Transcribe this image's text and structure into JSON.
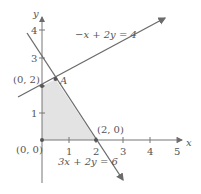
{
  "axes": {
    "x_label": "x",
    "y_label": "y",
    "x_ticks": [
      "1",
      "2",
      "3",
      "4",
      "5"
    ],
    "y_ticks": [
      "1",
      "2",
      "3",
      "4"
    ]
  },
  "lines": [
    {
      "equation": "−x + 2y = 4"
    },
    {
      "equation": "3x + 2y = 6"
    }
  ],
  "points": {
    "origin": "(0, 0)",
    "y_intercept": "(0, 2)",
    "x_intercept": "(2, 0)",
    "A": "A"
  },
  "colors": {
    "region_fill": "#e3e3e3",
    "line": "#6b6b6b",
    "axis": "#777777"
  }
}
